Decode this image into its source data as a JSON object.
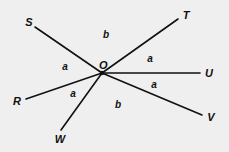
{
  "diagram": {
    "center": {
      "label": "O",
      "x": 102,
      "y": 73
    },
    "rays": [
      {
        "label": "S",
        "end": {
          "x": 35,
          "y": 27
        },
        "label_pos": {
          "x": 29,
          "y": 26
        }
      },
      {
        "label": "T",
        "end": {
          "x": 178,
          "y": 19
        },
        "label_pos": {
          "x": 186,
          "y": 19
        }
      },
      {
        "label": "U",
        "end": {
          "x": 200,
          "y": 73
        },
        "label_pos": {
          "x": 209,
          "y": 77
        }
      },
      {
        "label": "V",
        "end": {
          "x": 202,
          "y": 115
        },
        "label_pos": {
          "x": 211,
          "y": 121
        }
      },
      {
        "label": "W",
        "end": {
          "x": 61,
          "y": 130
        },
        "label_pos": {
          "x": 60,
          "y": 143
        }
      },
      {
        "label": "R",
        "end": {
          "x": 26,
          "y": 99
        },
        "label_pos": {
          "x": 17,
          "y": 105
        }
      }
    ],
    "angles": [
      {
        "label": "b",
        "between": [
          "S",
          "T"
        ],
        "x": 106,
        "y": 38
      },
      {
        "label": "a",
        "between": [
          "T",
          "U"
        ],
        "x": 150,
        "y": 62
      },
      {
        "label": "a",
        "between": [
          "U",
          "V"
        ],
        "x": 154,
        "y": 88
      },
      {
        "label": "b",
        "between": [
          "V",
          "W"
        ],
        "x": 118,
        "y": 108
      },
      {
        "label": "a",
        "between": [
          "W",
          "R"
        ],
        "x": 73,
        "y": 97
      },
      {
        "label": "a",
        "between": [
          "R",
          "S"
        ],
        "x": 65,
        "y": 70
      }
    ],
    "colors": {
      "background": "#efefef",
      "ink": "#111111"
    }
  }
}
